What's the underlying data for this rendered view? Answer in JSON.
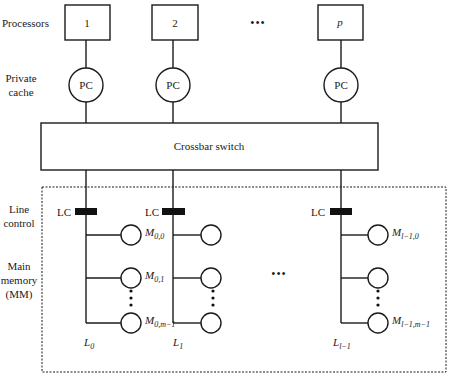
{
  "side_labels": {
    "processors": "Processors",
    "private_cache": [
      "Private",
      "cache"
    ],
    "line_control": [
      "Line",
      "control"
    ],
    "main_memory": [
      "Main",
      "memory",
      "(MM)"
    ]
  },
  "processors": [
    {
      "label": "1",
      "italic": false
    },
    {
      "label": "2",
      "italic": false
    },
    {
      "label": "p",
      "italic": true
    }
  ],
  "private_cache_label": "PC",
  "crossbar_label": "Crossbar switch",
  "line_control_label": "LC",
  "ellipsis": "•••",
  "lines": [
    {
      "label": "L",
      "sub": "0",
      "modules": [
        {
          "label": "M",
          "sub": "0,0"
        },
        {
          "label": "M",
          "sub": "0,1"
        },
        {
          "label": "M",
          "sub": "0,m−1"
        }
      ]
    },
    {
      "label": "L",
      "sub": "1",
      "modules": [
        {
          "label": "",
          "sub": ""
        },
        {
          "label": "",
          "sub": ""
        },
        {
          "label": "",
          "sub": ""
        }
      ]
    },
    {
      "label": "L",
      "sub": "l−1",
      "modules": [
        {
          "label": "M",
          "sub": "l−1,0"
        },
        {
          "label": "",
          "sub": ""
        },
        {
          "label": "M",
          "sub": "l−1,m−1"
        }
      ]
    }
  ]
}
